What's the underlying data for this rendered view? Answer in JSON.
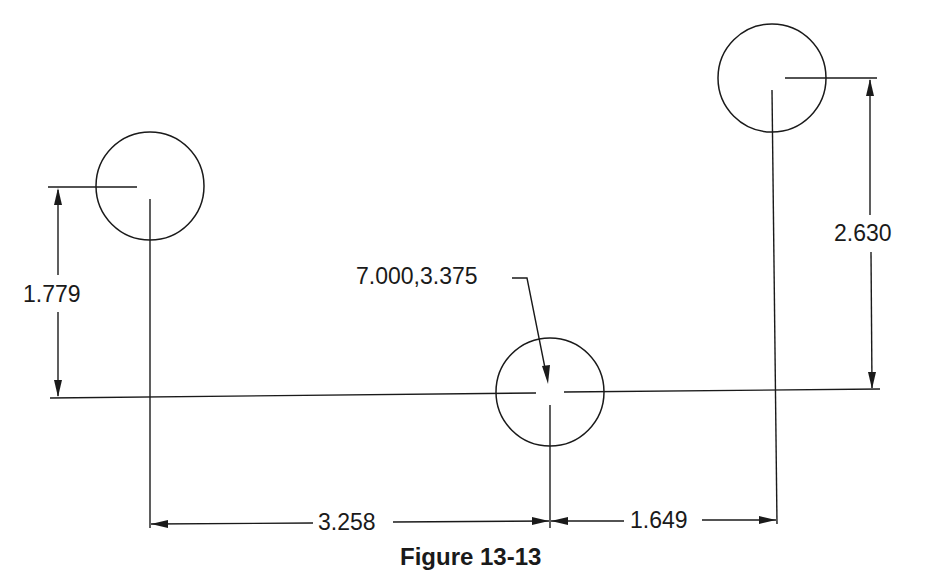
{
  "figure": {
    "caption": "Figure 13-13",
    "line_color": "#1a1a1a",
    "background": "#ffffff"
  },
  "holes": [
    {
      "name": "left-hole",
      "cx": 150,
      "cy": 186,
      "r": 54
    },
    {
      "name": "middle-hole",
      "cx": 550,
      "cy": 392,
      "r": 54
    },
    {
      "name": "right-hole",
      "cx": 772,
      "cy": 78,
      "r": 54
    }
  ],
  "dimensions": {
    "left_vertical": "1.779",
    "right_vertical": "2.630",
    "bottom_left_horizontal": "3.258",
    "bottom_right_horizontal": "1.649",
    "origin_leader": "7.000,3.375"
  }
}
